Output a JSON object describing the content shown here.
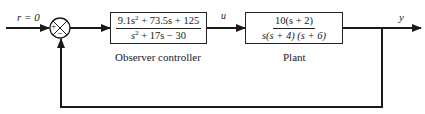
{
  "diagram": {
    "type": "block-diagram",
    "input_label": "r = 0",
    "summing_junction": {
      "plus_sign": "+",
      "minus_sign": "−"
    },
    "controller": {
      "numerator": {
        "a": "9.1s",
        "a_exp": "2",
        "rest": " + 73.5s + 125"
      },
      "denominator": {
        "a": "s",
        "a_exp": "2",
        "rest": " + 17s − 30"
      },
      "caption": "Observer controller"
    },
    "control_signal_label": "u",
    "plant": {
      "numerator": "10(s + 2)",
      "denominator": "s(s + 4) (s + 6)",
      "caption": "Plant"
    },
    "output_label": "y"
  }
}
